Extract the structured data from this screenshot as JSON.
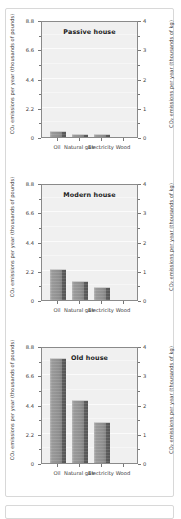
{
  "figure": {
    "y_axis_left_label": "CO₂ emissions per year (thousands of pounds)",
    "y_axis_right_label": "CO₂ emissions per year (thousands of kg)",
    "categories": [
      "Oil",
      "Natural gas",
      "Electricity",
      "Wood"
    ],
    "left_ticks": [
      "0",
      "2.2",
      "4.4",
      "6.6",
      "8.8"
    ],
    "right_ticks": [
      "0",
      "1",
      "2",
      "3",
      "4"
    ],
    "bar_color": "#8f8f8f",
    "bar_shadow_color": "#565656",
    "plot_background": "#f0f0f0"
  },
  "chart_data": [
    {
      "type": "bar",
      "title": "Passive house",
      "categories": [
        "Oil",
        "Natural gas",
        "Electricity",
        "Wood"
      ],
      "values": [
        0.42,
        0.26,
        0.2,
        0.0
      ],
      "xlabel": "",
      "ylabel": "CO₂ emissions per year (thousands of pounds)",
      "ylabel_secondary": "CO₂ emissions per year (thousands of kg)",
      "ylim": [
        0,
        8.8
      ],
      "ylim_secondary": [
        0,
        4
      ],
      "yticks": [
        0,
        2.2,
        4.4,
        6.6,
        8.8
      ],
      "yticks_secondary": [
        0,
        1,
        2,
        3,
        4
      ],
      "grid": true,
      "legend": "none"
    },
    {
      "type": "bar",
      "title": "Modern house",
      "categories": [
        "Oil",
        "Natural gas",
        "Electricity",
        "Wood"
      ],
      "values": [
        2.3,
        1.42,
        1.0,
        0.0
      ],
      "xlabel": "",
      "ylabel": "CO₂ emissions per year (thousands of pounds)",
      "ylabel_secondary": "CO₂ emissions per year (thousands of kg)",
      "ylim": [
        0,
        8.8
      ],
      "ylim_secondary": [
        0,
        4
      ],
      "yticks": [
        0,
        2.2,
        4.4,
        6.6,
        8.8
      ],
      "yticks_secondary": [
        0,
        1,
        2,
        3,
        4
      ],
      "grid": true,
      "legend": "none"
    },
    {
      "type": "bar",
      "title": "Old house",
      "categories": [
        "Oil",
        "Natural gas",
        "Electricity",
        "Wood"
      ],
      "values": [
        7.9,
        4.75,
        3.05,
        0.0
      ],
      "xlabel": "",
      "ylabel": "CO₂ emissions per year (thousands of pounds)",
      "ylabel_secondary": "CO₂ emissions per year (thousands of kg)",
      "ylim": [
        0,
        8.8
      ],
      "ylim_secondary": [
        0,
        4
      ],
      "yticks": [
        0,
        2.2,
        4.4,
        6.6,
        8.8
      ],
      "yticks_secondary": [
        0,
        1,
        2,
        3,
        4
      ],
      "grid": true,
      "legend": "none"
    }
  ]
}
